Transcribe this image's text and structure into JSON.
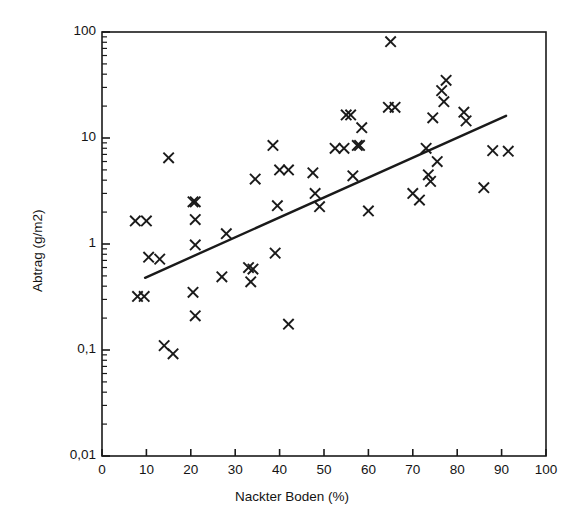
{
  "chart_data": {
    "type": "scatter",
    "title": "",
    "xlabel": "Nackter Boden (%)",
    "ylabel": "Abtrag (g/m2)",
    "xscale": "linear",
    "yscale": "log",
    "xlim": [
      0,
      100
    ],
    "ylim": [
      0.01,
      100
    ],
    "grid": false,
    "legend": null,
    "x_ticks": [
      "0",
      "10",
      "20",
      "30",
      "40",
      "50",
      "60",
      "70",
      "80",
      "90",
      "100"
    ],
    "y_ticks": [
      "0,01",
      "0,1",
      "1",
      "10",
      "100"
    ],
    "marker": "x",
    "marker_color": "#1a1a1a",
    "line_color": "#1a1a1a",
    "points": [
      {
        "x": 7.5,
        "y": 1.65
      },
      {
        "x": 8.0,
        "y": 0.32
      },
      {
        "x": 9.5,
        "y": 0.32
      },
      {
        "x": 10.0,
        "y": 1.65
      },
      {
        "x": 10.5,
        "y": 0.75
      },
      {
        "x": 13.0,
        "y": 0.72
      },
      {
        "x": 14.0,
        "y": 0.11
      },
      {
        "x": 15.0,
        "y": 6.5
      },
      {
        "x": 16.0,
        "y": 0.092
      },
      {
        "x": 20.5,
        "y": 2.5
      },
      {
        "x": 21.0,
        "y": 2.5
      },
      {
        "x": 21.0,
        "y": 1.7
      },
      {
        "x": 21.0,
        "y": 0.98
      },
      {
        "x": 20.5,
        "y": 0.35
      },
      {
        "x": 21.0,
        "y": 0.21
      },
      {
        "x": 27.0,
        "y": 0.49
      },
      {
        "x": 28.0,
        "y": 1.25
      },
      {
        "x": 33.0,
        "y": 0.6
      },
      {
        "x": 34.0,
        "y": 0.58
      },
      {
        "x": 33.5,
        "y": 0.44
      },
      {
        "x": 34.5,
        "y": 4.1
      },
      {
        "x": 38.5,
        "y": 8.5
      },
      {
        "x": 39.0,
        "y": 0.82
      },
      {
        "x": 39.5,
        "y": 2.3
      },
      {
        "x": 40.0,
        "y": 5.0
      },
      {
        "x": 42.0,
        "y": 5.0
      },
      {
        "x": 42.0,
        "y": 0.175
      },
      {
        "x": 47.5,
        "y": 4.7
      },
      {
        "x": 48.0,
        "y": 3.0
      },
      {
        "x": 49.0,
        "y": 2.25
      },
      {
        "x": 52.5,
        "y": 8.0
      },
      {
        "x": 54.5,
        "y": 8.0
      },
      {
        "x": 55.0,
        "y": 16.5
      },
      {
        "x": 56.0,
        "y": 16.5
      },
      {
        "x": 56.5,
        "y": 4.4
      },
      {
        "x": 57.5,
        "y": 8.5
      },
      {
        "x": 58.0,
        "y": 8.5
      },
      {
        "x": 58.5,
        "y": 12.5
      },
      {
        "x": 60.0,
        "y": 2.05
      },
      {
        "x": 64.5,
        "y": 19.5
      },
      {
        "x": 65.0,
        "y": 81.0
      },
      {
        "x": 66.0,
        "y": 19.5
      },
      {
        "x": 70.0,
        "y": 3.0
      },
      {
        "x": 71.5,
        "y": 2.6
      },
      {
        "x": 73.0,
        "y": 8.0
      },
      {
        "x": 73.5,
        "y": 4.5
      },
      {
        "x": 74.0,
        "y": 3.9
      },
      {
        "x": 74.5,
        "y": 15.5
      },
      {
        "x": 75.5,
        "y": 6.0
      },
      {
        "x": 76.5,
        "y": 28.0
      },
      {
        "x": 77.0,
        "y": 22.0
      },
      {
        "x": 77.5,
        "y": 35.0
      },
      {
        "x": 81.5,
        "y": 17.5
      },
      {
        "x": 82.0,
        "y": 14.5
      },
      {
        "x": 86.0,
        "y": 3.4
      },
      {
        "x": 88.0,
        "y": 7.6
      },
      {
        "x": 91.5,
        "y": 7.5
      }
    ],
    "fit_line": {
      "label": "regression",
      "x_start": 9.7,
      "y_start": 0.48,
      "x_end": 91.0,
      "y_end": 16.2
    }
  }
}
